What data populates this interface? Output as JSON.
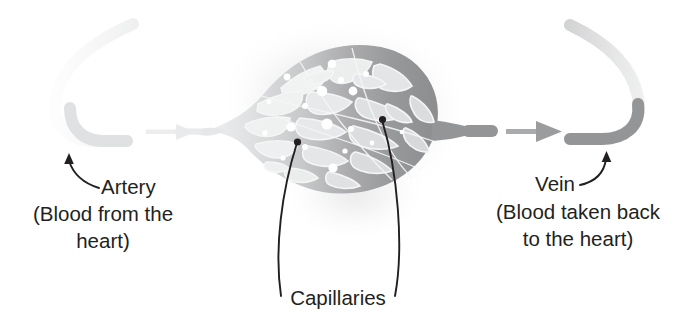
{
  "diagram": {
    "background_color": "#ffffff",
    "text_color": "#231f20"
  },
  "labels": {
    "artery": {
      "name": "Artery",
      "detail_line1": "(Blood from the",
      "detail_line2": "heart)"
    },
    "vein": {
      "name": "Vein",
      "detail_line1": "(Blood taken back",
      "detail_line2": "to the heart)"
    },
    "capillaries": {
      "name": "Capillaries"
    }
  },
  "parts": {
    "artery_vessel": {
      "label": "artery-vessel",
      "color": "#e3e4e6",
      "description": "pale grey hooked tube entering from upper left"
    },
    "vein_vessel": {
      "label": "vein-vessel",
      "color": "#949698",
      "description": "mid grey hooked tube exiting to upper right"
    },
    "capillary_network": {
      "label": "capillary-network",
      "color_left": "#d7d8da",
      "color_right": "#8f9193",
      "outline_color": "#f2f2f2",
      "description": "leaf-shaped mesh of branching vessels with red blood cell dots"
    },
    "flow_arrow_left": {
      "label": "flow-arrow-left",
      "color": "#ececed",
      "direction": "right"
    },
    "flow_arrow_right": {
      "label": "flow-arrow-right",
      "color": "#9a9c9e",
      "direction": "right"
    },
    "blood_cells": {
      "label": "blood-cell-dot",
      "color": "#ffffff"
    },
    "leader_lines": {
      "label": "leader-line",
      "color": "#231f20"
    }
  }
}
